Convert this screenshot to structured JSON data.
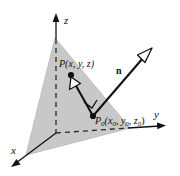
{
  "figure": {
    "type": "3d-plane-normal-vector-diagram",
    "background_color": "#ffffff",
    "plane_fill_color": "#c8c8c8",
    "line_color": "#111111",
    "axes": {
      "z_label": "z",
      "y_label": "y",
      "x_label": "x",
      "origin": [
        56,
        133
      ],
      "z_tip": [
        56,
        16
      ],
      "y_tip": [
        166,
        125
      ],
      "x_tip": [
        10,
        168
      ],
      "dashed_inside_plane": true
    },
    "plane": {
      "name": "shaded-plane",
      "vertices": [
        [
          55,
          38
        ],
        [
          130,
          128
        ],
        [
          26,
          155
        ]
      ],
      "edge_color": "#b0b0b0"
    },
    "points": [
      {
        "name": "point-P",
        "label": "P(x, y, z)",
        "label_parts": {
          "base": "P",
          "args": "(x, y, z)"
        },
        "dot": [
          71,
          75
        ],
        "label_pos": [
          61,
          67
        ]
      },
      {
        "name": "point-P0",
        "label": "P0(x0, y0, z0)",
        "label_parts": {
          "base": "P",
          "base_sub": "0",
          "args": [
            "(x",
            "0",
            ", y",
            "0",
            ", z",
            "0",
            ")"
          ]
        },
        "dot": [
          93,
          116
        ],
        "label_pos": [
          96,
          123
        ]
      }
    ],
    "vectors": [
      {
        "name": "normal-vector-n",
        "label": "n",
        "label_pos": [
          119,
          70
        ],
        "from": [
          93,
          116
        ],
        "to": [
          152,
          48
        ],
        "arrowhead": "hollow",
        "bold": true
      },
      {
        "name": "vector-P0-to-P",
        "label": "",
        "from": [
          93,
          116
        ],
        "to": [
          71,
          77
        ],
        "arrowhead": "hollow"
      }
    ],
    "right_angle_marker": {
      "name": "right-angle-marker",
      "position": [
        93,
        116
      ],
      "size": 9
    }
  }
}
